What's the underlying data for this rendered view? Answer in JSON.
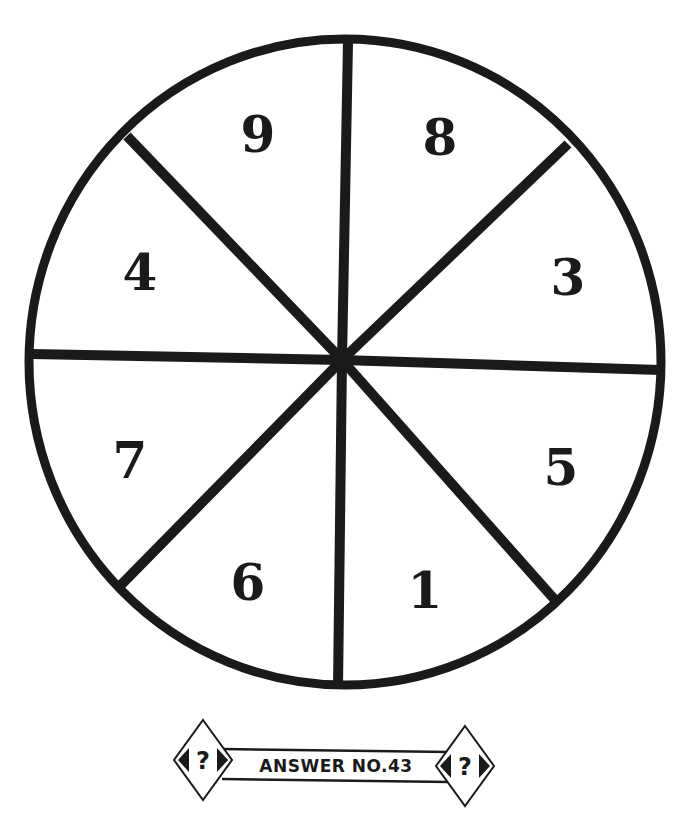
{
  "puzzle": {
    "type": "number-wheel",
    "segments": [
      {
        "position": "top-left",
        "value": "9"
      },
      {
        "position": "top-right",
        "value": "8"
      },
      {
        "position": "right-upper",
        "value": "3"
      },
      {
        "position": "right-lower",
        "value": "5"
      },
      {
        "position": "bottom-right",
        "value": "1"
      },
      {
        "position": "bottom-left",
        "value": "6"
      },
      {
        "position": "left-lower",
        "value": "7"
      },
      {
        "position": "left-upper",
        "value": "4"
      }
    ]
  },
  "banner": {
    "label": "ANSWER NO.43",
    "left_icon": "question-mark-icon",
    "right_icon": "question-mark-icon",
    "left_symbol": "?",
    "right_symbol": "?"
  },
  "colors": {
    "ink": "#1a1a1a",
    "background": "#ffffff"
  }
}
